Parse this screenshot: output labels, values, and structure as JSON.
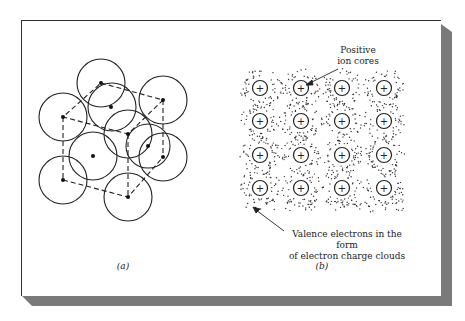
{
  "figure": {
    "panel_a": {
      "caption": "(a)",
      "description": "Close-packed atoms with dashed unit-cell outline"
    },
    "panel_b": {
      "caption": "(b)",
      "label_top": [
        "Positive",
        "ion cores"
      ],
      "label_bottom": [
        "Valence electrons in the form",
        "of electron charge clouds"
      ],
      "ion_symbol": "+",
      "grid": {
        "rows": 4,
        "cols": 4
      }
    },
    "colors": {
      "ink": "#222222",
      "shadow": "#7a7a7a",
      "background": "#ffffff"
    }
  }
}
